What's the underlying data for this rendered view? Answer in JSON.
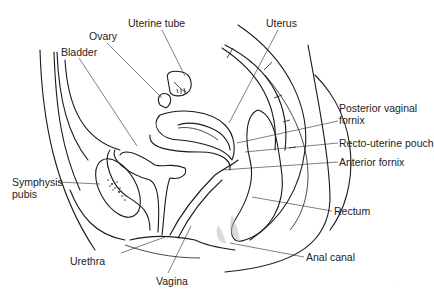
{
  "diagram": {
    "background": "#ffffff",
    "line_color": "#1a1a1a",
    "labels": [
      {
        "id": "uterine-tube",
        "text": "Uterine tube",
        "x": 128,
        "y": 17,
        "leader": [
          [
            162,
            30
          ],
          [
            185,
            76
          ]
        ]
      },
      {
        "id": "ovary",
        "text": "Ovary",
        "x": 89,
        "y": 30,
        "leader": [
          [
            107,
            43
          ],
          [
            162,
            98
          ]
        ]
      },
      {
        "id": "uterus",
        "text": "Uterus",
        "x": 266,
        "y": 17,
        "leader": [
          [
            278,
            30
          ],
          [
            229,
            123
          ]
        ]
      },
      {
        "id": "bladder",
        "text": "Bladder",
        "x": 61,
        "y": 46,
        "leader": [
          [
            79,
            58
          ],
          [
            137,
            146
          ]
        ]
      },
      {
        "id": "posterior-vaginal-fornix",
        "text": "Posterior vaginal",
        "text2": "fornix",
        "x": 339,
        "y": 102,
        "leader": [
          [
            338,
            121
          ],
          [
            237,
            143
          ]
        ]
      },
      {
        "id": "recto-uterine-pouch",
        "text": "Recto-uterine pouch",
        "x": 339,
        "y": 137,
        "leader": [
          [
            338,
            143
          ],
          [
            245,
            152
          ]
        ]
      },
      {
        "id": "anterior-fornix",
        "text": "Anterior fornix",
        "x": 339,
        "y": 156,
        "leader": [
          [
            338,
            162
          ],
          [
            222,
            170
          ]
        ]
      },
      {
        "id": "symphysis-pubis",
        "text": "Symphysis",
        "text2": "pubis",
        "x": 12,
        "y": 176,
        "leader": [
          [
            58,
            182
          ],
          [
            100,
            184
          ]
        ]
      },
      {
        "id": "rectum",
        "text": "Rectum",
        "x": 334,
        "y": 205,
        "leader": [
          [
            332,
            211
          ],
          [
            252,
            197
          ]
        ]
      },
      {
        "id": "urethra",
        "text": "Urethra",
        "x": 70,
        "y": 255,
        "leader": [
          [
            121,
            253
          ],
          [
            165,
            237
          ]
        ]
      },
      {
        "id": "anal-canal",
        "text": "Anal canal",
        "x": 306,
        "y": 251,
        "leader": [
          [
            304,
            257
          ],
          [
            230,
            243
          ]
        ]
      },
      {
        "id": "vagina",
        "text": "Vagina",
        "x": 156,
        "y": 275,
        "leader": [
          [
            168,
            273
          ],
          [
            191,
            226
          ]
        ]
      }
    ],
    "watermark": "· · ·"
  }
}
